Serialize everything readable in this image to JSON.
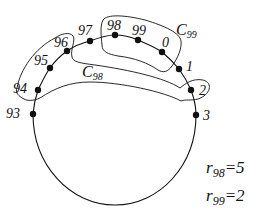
{
  "diagram": {
    "nodes": [
      {
        "label": "93",
        "x": 33,
        "y": 114,
        "lx": 6,
        "ly": 107
      },
      {
        "label": "94",
        "x": 38,
        "y": 90,
        "lx": 13,
        "ly": 82
      },
      {
        "label": "95",
        "x": 50,
        "y": 68,
        "lx": 34,
        "ly": 54
      },
      {
        "label": "96",
        "x": 67,
        "y": 51,
        "lx": 54,
        "ly": 36
      },
      {
        "label": "97",
        "x": 90,
        "y": 41,
        "lx": 78,
        "ly": 24
      },
      {
        "label": "98",
        "x": 115,
        "y": 35,
        "lx": 107,
        "ly": 19
      },
      {
        "label": "99",
        "x": 138,
        "y": 40,
        "lx": 132,
        "ly": 24
      },
      {
        "label": "0",
        "x": 162,
        "y": 52,
        "lx": 162,
        "ly": 36
      },
      {
        "label": "1",
        "x": 179,
        "y": 69,
        "lx": 186,
        "ly": 60
      },
      {
        "label": "2",
        "x": 191,
        "y": 90,
        "lx": 199,
        "ly": 84
      },
      {
        "label": "3",
        "x": 196,
        "y": 115,
        "lx": 203,
        "ly": 109
      }
    ],
    "clusters": [
      {
        "name": "C",
        "sub": "98",
        "lx": 82,
        "ly": 64
      },
      {
        "name": "C",
        "sub": "99",
        "lx": 176,
        "ly": 22
      }
    ],
    "equations": [
      {
        "var": "r",
        "sub": "98",
        "value": "=5",
        "x": 206,
        "y": 159
      },
      {
        "var": "r",
        "sub": "99",
        "value": "=2",
        "x": 206,
        "y": 187
      }
    ],
    "colors": {
      "stroke": "#111111",
      "fill": "#111111",
      "background": "#ffffff"
    }
  }
}
